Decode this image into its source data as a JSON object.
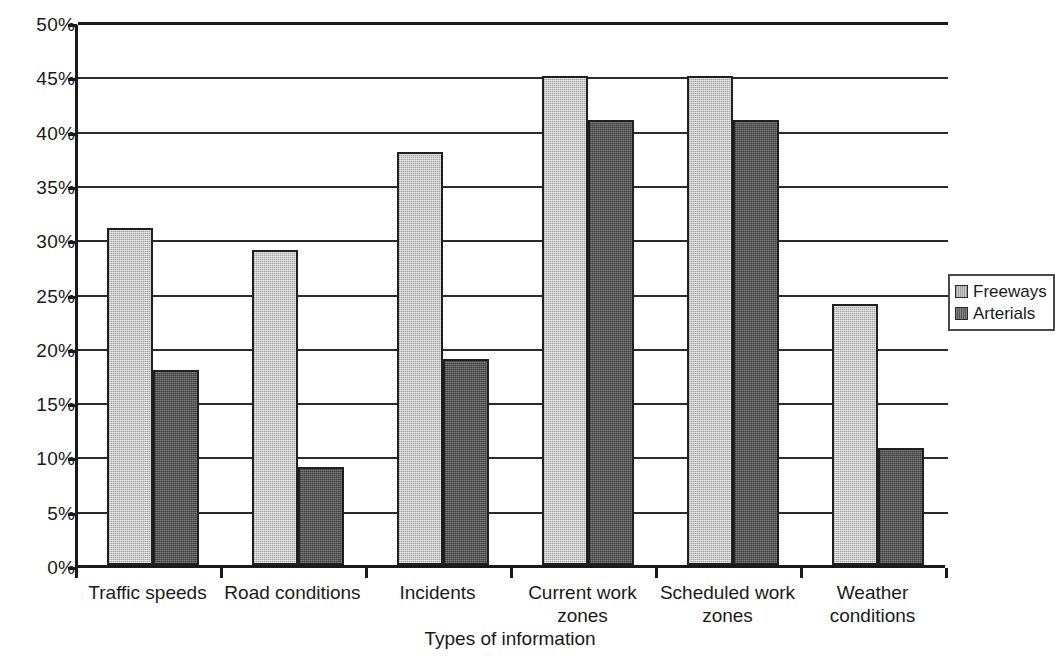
{
  "chart_data": {
    "type": "bar",
    "title": "",
    "xlabel": "Types of information",
    "ylabel": "",
    "categories": [
      "Traffic speeds",
      "Road conditions",
      "Incidents",
      "Current work zones",
      "Scheduled work zones",
      "Weather conditions"
    ],
    "category_lines": [
      [
        "Traffic speeds"
      ],
      [
        "Road conditions"
      ],
      [
        "Incidents"
      ],
      [
        "Current work",
        "zones"
      ],
      [
        "Scheduled work",
        "zones"
      ],
      [
        "Weather",
        "conditions"
      ]
    ],
    "series": [
      {
        "name": "Freeways",
        "color": "#c9c9c9",
        "values": [
          31,
          29,
          38,
          45,
          45,
          24
        ]
      },
      {
        "name": "Arterials",
        "color": "#585858",
        "values": [
          18,
          9,
          19,
          41,
          41,
          10.8
        ]
      }
    ],
    "ylim": [
      0,
      50
    ],
    "ytick_values": [
      0,
      5,
      10,
      15,
      20,
      25,
      30,
      35,
      40,
      45,
      50
    ],
    "ytick_labels": [
      "0%",
      "5%",
      "10%",
      "15%",
      "20%",
      "25%",
      "30%",
      "35%",
      "40%",
      "45%",
      "50%"
    ],
    "grid": true,
    "grid_axis": "y",
    "legend_position": "right"
  },
  "legend": {
    "entries": [
      {
        "label": "Freeways"
      },
      {
        "label": "Arterials"
      }
    ]
  },
  "axis": {
    "x_title": "Types of information"
  }
}
